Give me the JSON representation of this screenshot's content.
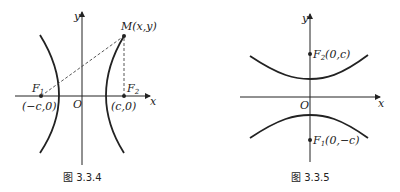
{
  "figures": [
    {
      "caption": "图 3.3.4",
      "axis_x_label": "x",
      "axis_y_label": "y",
      "origin_label": "O",
      "point_m_label": "M(x,y)",
      "f1_label": "F",
      "f1_sub": "1",
      "f2_label": "F",
      "f2_sub": "2",
      "f1_coord": "(−c,0)",
      "f2_coord": "(c,0)"
    },
    {
      "caption": "图 3.3.5",
      "axis_x_label": "x",
      "axis_y_label": "y",
      "origin_label": "O",
      "f2_label": "F",
      "f2_sub": "2",
      "f2_coord": "(0,c)",
      "f1_label": "F",
      "f1_sub": "1",
      "f1_coord": "(0,−c)"
    }
  ]
}
